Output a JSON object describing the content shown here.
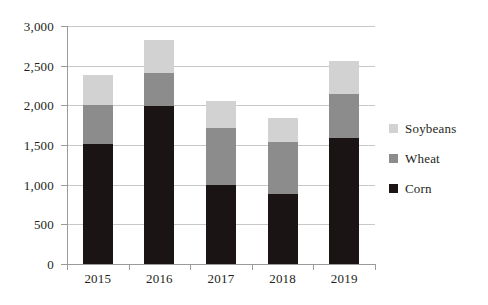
{
  "chart_data": {
    "type": "bar",
    "subtype": "stacked-vertical-bar",
    "title": "",
    "subtitle": "",
    "xlabel": "",
    "ylabel": "",
    "categories": [
      "2015",
      "2016",
      "2017",
      "2018",
      "2019"
    ],
    "series": [
      {
        "name": "Corn",
        "color": "#1a1414",
        "values": [
          1510,
          1990,
          1000,
          880,
          1585
        ]
      },
      {
        "name": "Wheat",
        "color": "#8c8c8c",
        "values": [
          490,
          420,
          720,
          655,
          555
        ]
      },
      {
        "name": "Soybeans",
        "color": "#d2d2d2",
        "values": [
          385,
          410,
          330,
          305,
          420
        ]
      }
    ],
    "stack_totals": [
      2385,
      2820,
      2050,
      1840,
      2560
    ],
    "ylim": [
      0,
      3000
    ],
    "ytick_values": [
      0,
      500,
      1000,
      1500,
      2000,
      2500,
      3000
    ],
    "ytick_labels": [
      "0",
      "500",
      "1,000",
      "1,500",
      "2,000",
      "2,500",
      "3,000"
    ],
    "grid": {
      "horizontal": true,
      "vertical": false
    },
    "legend": {
      "position": "right",
      "entries": [
        {
          "label": "Soybeans",
          "color": "#d2d2d2"
        },
        {
          "label": "Wheat",
          "color": "#8c8c8c"
        },
        {
          "label": "Corn",
          "color": "#1a1414"
        }
      ]
    },
    "axis_color": "#9a9a9a",
    "gridline_color": "#c8c8c8",
    "text_color": "#231f20",
    "background": "#ffffff"
  }
}
